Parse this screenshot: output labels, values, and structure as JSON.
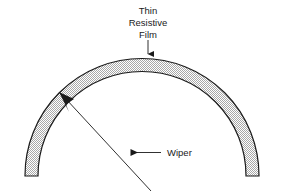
{
  "figure": {
    "type": "technical-diagram",
    "background_color": "#ffffff",
    "line_color": "#1a1a1a",
    "film_fill_color": "#d9d9d9",
    "film_fill_pattern": "fine-stipple-checker"
  },
  "labels": {
    "film": {
      "line1": "Thin",
      "line2": "Resistive",
      "line3": "Film",
      "leader": "down-arrow-to-arc-top"
    },
    "wiper": {
      "text": "Wiper",
      "leader": "left-arrow-to-wiper-line"
    }
  },
  "geometry": {
    "arc": {
      "center_x": 142,
      "center_y": 176,
      "outer_radius": 117,
      "inner_radius": 104,
      "start_angle_deg": 180,
      "end_angle_deg": 0,
      "end_cut": "flat-horizontal"
    },
    "wiper_line": {
      "from_x": 60,
      "from_y": 93,
      "to_x": 151,
      "to_y": 191,
      "arrowhead": "large-filled-triangle-at-top-left"
    },
    "film_leader": {
      "from_x": 148,
      "from_y": 40,
      "to_x": 148,
      "to_y": 60
    },
    "wiper_leader": {
      "from_x": 160,
      "from_y": 152,
      "to_x": 123,
      "to_y": 152
    }
  }
}
